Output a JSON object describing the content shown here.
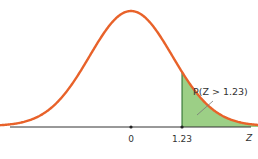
{
  "chart_data": {
    "type": "area",
    "title": "",
    "distribution": "standard normal",
    "mean": 0,
    "sd": 1,
    "xlabel": "Z",
    "ylabel": "",
    "xlim": [
      -3.5,
      3.5
    ],
    "tick_labels": [
      "0",
      "1.23"
    ],
    "ticks": [
      0,
      1.23
    ],
    "shaded_region": {
      "from": 1.23,
      "to": 3.5,
      "color": "#8fc87a",
      "edge_color": "#3a7a3a"
    },
    "annotation": "P(Z > 1.23)",
    "curve_color": "#e8622a",
    "axis_color": "#333333",
    "grid": false,
    "legend": "none"
  }
}
